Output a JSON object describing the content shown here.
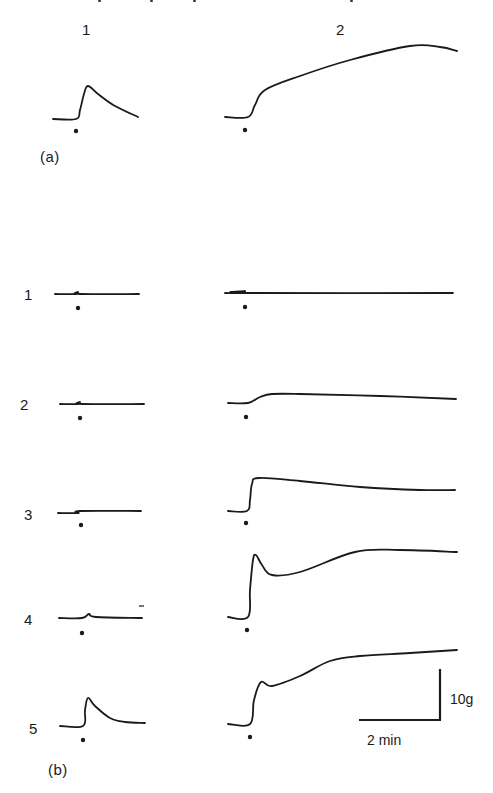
{
  "figure": {
    "column_headers": [
      "1",
      "2"
    ],
    "panel_labels": {
      "a": "(a)",
      "b": "(b)"
    },
    "row_labels": [
      "1",
      "2",
      "3",
      "4",
      "5"
    ],
    "scale_bar": {
      "force_label": "10g",
      "time_label": "2 min"
    },
    "stimulus_marker": "•",
    "ink_color": "#1a1a1a",
    "background_color": "#ffffff"
  },
  "chart_data": {
    "type": "line",
    "title": "",
    "xlabel": "time",
    "ylabel": "tension",
    "scale": {
      "y": "10 g",
      "x": "2 min"
    },
    "grid": false,
    "panels": [
      {
        "panel": "(a)",
        "traces": [
          {
            "column": "1",
            "points": [
              [
                53,
                119
              ],
              [
                76,
                119
              ],
              [
                80,
                110
              ],
              [
                84,
                94
              ],
              [
                88,
                86
              ],
              [
                98,
                94
              ],
              [
                115,
                106
              ],
              [
                138,
                117
              ]
            ]
          },
          {
            "column": "2",
            "points": [
              [
                225,
                117
              ],
              [
                248,
                117
              ],
              [
                255,
                105
              ],
              [
                265,
                90
              ],
              [
                300,
                76
              ],
              [
                350,
                60
              ],
              [
                410,
                46
              ],
              [
                440,
                47
              ],
              [
                457,
                51
              ]
            ]
          }
        ]
      },
      {
        "panel": "(b)",
        "rows": [
          {
            "row": "1",
            "traces": [
              {
                "column": "1",
                "points": [
                  [
                    55,
                    294
                  ],
                  [
                    76,
                    294
                  ],
                  [
                    78,
                    292
                  ],
                  [
                    80,
                    294
                  ],
                  [
                    139,
                    294
                  ]
                ]
              },
              {
                "column": "2",
                "points": [
                  [
                    225,
                    293
                  ],
                  [
                    243,
                    293
                  ],
                  [
                    245,
                    291
                  ],
                  [
                    247,
                    293
                  ],
                  [
                    453,
                    293
                  ]
                ]
              }
            ]
          },
          {
            "row": "2",
            "traces": [
              {
                "column": "1",
                "points": [
                  [
                    60,
                    404
                  ],
                  [
                    78,
                    404
                  ],
                  [
                    80,
                    402
                  ],
                  [
                    82,
                    404
                  ],
                  [
                    144,
                    404
                  ]
                ]
              },
              {
                "column": "2",
                "points": [
                  [
                    228,
                    403
                  ],
                  [
                    248,
                    403
                  ],
                  [
                    260,
                    397
                  ],
                  [
                    272,
                    394
                  ],
                  [
                    300,
                    394
                  ],
                  [
                    380,
                    396
                  ],
                  [
                    456,
                    399
                  ]
                ]
              }
            ]
          },
          {
            "row": "3",
            "traces": [
              {
                "column": "1",
                "points": [
                  [
                    58,
                    513
                  ],
                  [
                    78,
                    513
                  ],
                  [
                    80,
                    511
                  ],
                  [
                    141,
                    511
                  ]
                ]
              },
              {
                "column": "2",
                "points": [
                  [
                    228,
                    511
                  ],
                  [
                    247,
                    511
                  ],
                  [
                    250,
                    500
                  ],
                  [
                    252,
                    484
                  ],
                  [
                    259,
                    478
                  ],
                  [
                    300,
                    481
                  ],
                  [
                    360,
                    487
                  ],
                  [
                    420,
                    490
                  ],
                  [
                    455,
                    490
                  ]
                ]
              }
            ]
          },
          {
            "row": "4",
            "traces": [
              {
                "column": "1",
                "points": [
                  [
                    59,
                    618
                  ],
                  [
                    82,
                    618
                  ],
                  [
                    89,
                    614
                  ],
                  [
                    96,
                    617
                  ],
                  [
                    142,
                    618
                  ]
                ]
              },
              {
                "column": "2",
                "points": [
                  [
                    228,
                    617
                  ],
                  [
                    248,
                    617
                  ],
                  [
                    250,
                    590
                  ],
                  [
                    253,
                    560
                  ],
                  [
                    256,
                    555
                  ],
                  [
                    262,
                    565
                  ],
                  [
                    272,
                    575
                  ],
                  [
                    300,
                    572
                  ],
                  [
                    355,
                    552
                  ],
                  [
                    400,
                    550
                  ],
                  [
                    457,
                    552
                  ]
                ]
              }
            ]
          },
          {
            "row": "5",
            "traces": [
              {
                "column": "1",
                "points": [
                  [
                    60,
                    726
                  ],
                  [
                    83,
                    726
                  ],
                  [
                    85,
                    710
                  ],
                  [
                    88,
                    698
                  ],
                  [
                    95,
                    706
                  ],
                  [
                    110,
                    718
                  ],
                  [
                    125,
                    722
                  ],
                  [
                    145,
                    723
                  ]
                ]
              },
              {
                "column": "2",
                "points": [
                  [
                    228,
                    724
                  ],
                  [
                    250,
                    724
                  ],
                  [
                    254,
                    700
                  ],
                  [
                    261,
                    682
                  ],
                  [
                    272,
                    686
                  ],
                  [
                    300,
                    676
                  ],
                  [
                    330,
                    661
                  ],
                  [
                    360,
                    656
                  ],
                  [
                    410,
                    653
                  ],
                  [
                    457,
                    650
                  ]
                ]
              }
            ]
          }
        ]
      }
    ]
  }
}
